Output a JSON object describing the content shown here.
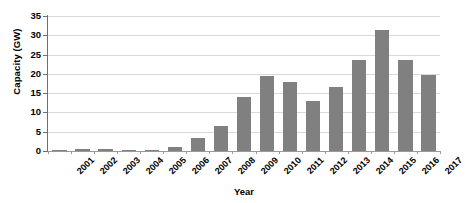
{
  "chart_data": {
    "type": "bar",
    "title": "",
    "xlabel": "Year",
    "ylabel": "Capacity (GW)",
    "categories": [
      "2001",
      "2002",
      "2003",
      "2004",
      "2005",
      "2006",
      "2007",
      "2008",
      "2009",
      "2010",
      "2011",
      "2012",
      "2013",
      "2014",
      "2015",
      "2016",
      "2017"
    ],
    "values": [
      0.2,
      0.4,
      0.6,
      0.1,
      0.3,
      1.0,
      3.5,
      6.5,
      14.0,
      19.5,
      18.0,
      13.0,
      16.5,
      23.5,
      31.5,
      23.5,
      19.8
    ],
    "ylim": [
      0,
      35
    ],
    "ytick_values": [
      0,
      5,
      10,
      15,
      20,
      25,
      30,
      35
    ],
    "ytick_labels": [
      "0",
      "5",
      "10",
      "15",
      "20",
      "25",
      "30",
      "35"
    ],
    "grid": true,
    "legend": null,
    "legend_position": "none",
    "bar_color": "#808080",
    "gridline_color": "#d9d9d9",
    "axis_color": "#6f6f6f",
    "background_color": "#ffffff"
  }
}
